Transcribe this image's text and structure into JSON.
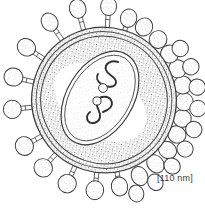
{
  "figure": {
    "name": "enveloped-virus-particle",
    "style": "stippled pen-and-ink scientific line drawing",
    "background_color": "#ffffff",
    "ink_color": "#3a3a3a",
    "stipple_color": "#6e6e6e"
  },
  "scale": {
    "label": "[110 nm]",
    "value": 110,
    "unit": "nm",
    "position": "bottom-right"
  },
  "structures": {
    "envelope": {
      "name": "viral-envelope",
      "shape": "ellipse",
      "cx": 104,
      "cy": 100,
      "rx": 72,
      "ry": 73,
      "rotation_deg": -28,
      "ring_count": 3,
      "fill": "stipple"
    },
    "matrix_ring": {
      "name": "matrix-layer",
      "shape": "ellipse",
      "cx": 104,
      "cy": 100,
      "rx": 63,
      "ry": 64,
      "rotation_deg": -28
    },
    "nucleocapsid": {
      "name": "nucleocapsid-core",
      "shape": "ellipse",
      "cx": 100,
      "cy": 98,
      "rx": 33,
      "ry": 51,
      "rotation_deg": 32,
      "outline_count": 2,
      "fill": "light-stipple"
    },
    "genome_strands": {
      "name": "genome-rna-strands",
      "count": 2,
      "description": "two S-shaped squiggly ribonucleoprotein segments"
    },
    "core_granules": {
      "name": "core-granules",
      "count": 2,
      "description": "two small stippled circles between the genome strands"
    },
    "spikes": {
      "name": "glycoprotein-spikes",
      "total_count": 30,
      "head_shape": "oval",
      "stalk_shape": "rectangular with crossbar",
      "description": "surface projections radiating from the envelope; foreshortened and overlapping on the lower-right rim"
    }
  },
  "spike_list": [
    {
      "angle": -97,
      "len": 22,
      "rx": 9.5,
      "ry": 8.0,
      "stalk": true
    },
    {
      "angle": -78,
      "len": 22,
      "rx": 9.5,
      "ry": 8.2,
      "stalk": true
    },
    {
      "angle": -59,
      "len": 21,
      "rx": 9.2,
      "ry": 8.0,
      "stalk": true
    },
    {
      "angle": -118,
      "len": 21,
      "rx": 9.5,
      "ry": 8.5,
      "stalk": true
    },
    {
      "angle": -138,
      "len": 21,
      "rx": 9.5,
      "ry": 9.0,
      "stalk": true
    },
    {
      "angle": -158,
      "len": 20,
      "rx": 9.0,
      "ry": 9.2,
      "stalk": true
    },
    {
      "angle": 178,
      "len": 20,
      "rx": 9.0,
      "ry": 9.5,
      "stalk": true
    },
    {
      "angle": 160,
      "len": 19,
      "rx": 9.0,
      "ry": 9.5,
      "stalk": true
    },
    {
      "angle": 142,
      "len": 19,
      "rx": 9.2,
      "ry": 9.2,
      "stalk": true
    },
    {
      "angle": 124,
      "len": 18,
      "rx": 9.5,
      "ry": 8.8,
      "stalk": true
    },
    {
      "angle": 108,
      "len": 15,
      "rx": 9.5,
      "ry": 8.2,
      "stalk": true
    },
    {
      "angle": 93,
      "len": 11,
      "rx": 9.8,
      "ry": 8.0,
      "stalk": false
    },
    {
      "angle": 79,
      "len": 9,
      "rx": 9.8,
      "ry": 8.0,
      "stalk": false
    },
    {
      "angle": 66,
      "len": 8,
      "rx": 9.5,
      "ry": 8.2,
      "stalk": false
    },
    {
      "angle": 53,
      "len": 8,
      "rx": 9.2,
      "ry": 8.5,
      "stalk": false
    },
    {
      "angle": 41,
      "len": 8,
      "rx": 9.0,
      "ry": 8.8,
      "stalk": false
    },
    {
      "angle": 29,
      "len": 8,
      "rx": 9.0,
      "ry": 9.0,
      "stalk": false
    },
    {
      "angle": 17,
      "len": 8,
      "rx": 9.0,
      "ry": 9.0,
      "stalk": false
    },
    {
      "angle": 5,
      "len": 8,
      "rx": 9.0,
      "ry": 9.0,
      "stalk": false
    },
    {
      "angle": -7,
      "len": 8,
      "rx": 9.0,
      "ry": 9.0,
      "stalk": false
    },
    {
      "angle": -20,
      "len": 9,
      "rx": 9.0,
      "ry": 8.8,
      "stalk": false
    },
    {
      "angle": -33,
      "len": 11,
      "rx": 9.2,
      "ry": 8.5,
      "stalk": false
    },
    {
      "angle": -45,
      "len": 13,
      "rx": 9.2,
      "ry": 8.2,
      "stalk": true
    },
    {
      "angle": 99,
      "len": 26,
      "rx": 8.5,
      "ry": 7.5,
      "stalk": false
    },
    {
      "angle": 86,
      "len": 24,
      "rx": 8.5,
      "ry": 7.5,
      "stalk": false
    },
    {
      "angle": 72,
      "len": 22,
      "rx": 8.5,
      "ry": 7.8,
      "stalk": false
    },
    {
      "angle": 59,
      "len": 22,
      "rx": 8.2,
      "ry": 8.0,
      "stalk": false
    },
    {
      "angle": 46,
      "len": 22,
      "rx": 8.2,
      "ry": 8.2,
      "stalk": false
    },
    {
      "angle": 33,
      "len": 22,
      "rx": 8.2,
      "ry": 8.2,
      "stalk": false
    },
    {
      "angle": 20,
      "len": 22,
      "rx": 8.2,
      "ry": 8.2,
      "stalk": false
    },
    {
      "angle": 7,
      "len": 21,
      "rx": 8.2,
      "ry": 8.2,
      "stalk": false
    },
    {
      "angle": -6,
      "len": 20,
      "rx": 8.2,
      "ry": 8.2,
      "stalk": false
    }
  ]
}
